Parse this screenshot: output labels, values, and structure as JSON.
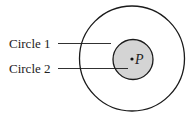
{
  "diagram": {
    "labels": {
      "circle1": "Circle 1",
      "circle2": "Circle 2",
      "point": "P"
    },
    "colors": {
      "stroke": "#1a1a1a",
      "inner_fill": "#d4d4d4",
      "background": "#ffffff"
    },
    "shapes": {
      "outer_circle": {
        "cx": 132,
        "cy": 58.5,
        "r": 52.5
      },
      "inner_circle": {
        "cx": 133,
        "cy": 59.5,
        "r": 20
      },
      "point": {
        "cx": 132,
        "cy": 59
      }
    }
  }
}
